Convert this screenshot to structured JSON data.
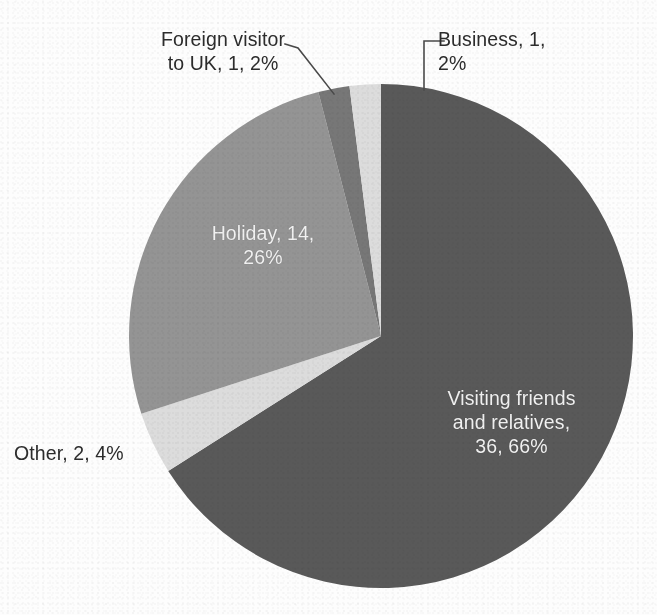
{
  "chart_data": {
    "type": "pie",
    "title": "",
    "subtitle": "",
    "xlabel": "",
    "ylabel": "",
    "legend_position": "none",
    "grid": false,
    "label_format": "name, value, percent",
    "total_value": 54,
    "categories": [
      "Visiting friends and relatives",
      "Holiday",
      "Other",
      "Business",
      "Foreign visitor to UK"
    ],
    "values": [
      36,
      14,
      2,
      1,
      1
    ],
    "percents": [
      66,
      26,
      4,
      2,
      2
    ],
    "slices": [
      {
        "name": "Visiting friends and relatives",
        "value": 36,
        "percent": 66,
        "color": "#595959",
        "label_text": "Visiting friends\nand relatives,\n36, 66%",
        "label_placement": "inside",
        "label_color": "#f2f2f2",
        "start_angle_deg": 0,
        "end_angle_deg": 237.6
      },
      {
        "name": "Other",
        "value": 2,
        "percent": 4,
        "color": "#dcdcdc",
        "label_text": "Other, 2, 4%",
        "label_placement": "outside",
        "label_color": "#2c2c2c",
        "start_angle_deg": 237.6,
        "end_angle_deg": 252.0
      },
      {
        "name": "Holiday",
        "value": 14,
        "percent": 26,
        "color": "#949494",
        "label_text": "Holiday, 14,\n26%",
        "label_placement": "inside",
        "label_color": "#f2f2f2",
        "start_angle_deg": 252.0,
        "end_angle_deg": 345.6
      },
      {
        "name": "Foreign visitor to UK",
        "value": 1,
        "percent": 2,
        "color": "#777777",
        "label_text": "Foreign visitor\nto UK, 1, 2%",
        "label_placement": "outside-leader",
        "label_color": "#2c2c2c",
        "start_angle_deg": 345.6,
        "end_angle_deg": 352.8
      },
      {
        "name": "Business",
        "value": 1,
        "percent": 2,
        "color": "#dcdcdc",
        "label_text": "Business, 1,\n2%",
        "label_placement": "outside-leader",
        "label_color": "#2c2c2c",
        "start_angle_deg": 352.8,
        "end_angle_deg": 360
      }
    ],
    "geometry": {
      "center_x": 381,
      "center_y": 336,
      "radius": 252
    },
    "background_color": "#fdfdfd",
    "leader_line_color": "#4a4a4a"
  }
}
